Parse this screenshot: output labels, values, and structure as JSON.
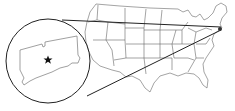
{
  "map": {
    "subject": "United States with magnified inset of Connecticut",
    "inset_region": "Connecticut",
    "marker": {
      "type": "star",
      "meaning": "location marker"
    },
    "colors": {
      "stroke": "#555555",
      "callout": "#222222",
      "background": "#ffffff",
      "marker": "#111111"
    }
  }
}
